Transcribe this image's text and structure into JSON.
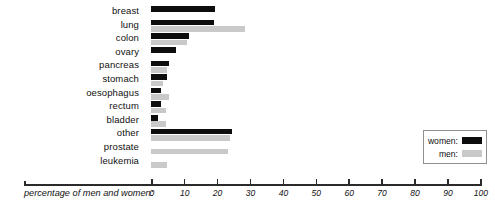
{
  "chart_data": {
    "type": "bar",
    "orientation": "horizontal",
    "title": "",
    "xlabel": "percentage of men and women:",
    "ylabel": "",
    "xlim": [
      0,
      100
    ],
    "xticks": [
      0,
      10,
      20,
      30,
      40,
      50,
      60,
      70,
      80,
      90,
      100
    ],
    "grid": false,
    "legend_position": "right",
    "categories": [
      "breast",
      "lung",
      "colon",
      "ovary",
      "pancreas",
      "stomach",
      "oesophagus",
      "rectum",
      "bladder",
      "other",
      "prostate",
      "leukemia"
    ],
    "series": [
      {
        "name": "women:",
        "color": "#0d0d0d",
        "values": [
          19.5,
          19,
          11.5,
          7.5,
          5.5,
          5,
          3,
          3,
          2,
          24.5,
          0,
          0
        ]
      },
      {
        "name": "men:",
        "color": "#c9c9c9",
        "values": [
          0,
          28.5,
          11,
          0,
          5,
          3.5,
          5.5,
          4.5,
          4.5,
          24,
          23.5,
          5
        ]
      }
    ]
  },
  "axis": {
    "label": "percentage of men and women:",
    "tick_labels": [
      "0",
      "10",
      "20",
      "30",
      "40",
      "50",
      "60",
      "70",
      "80",
      "90",
      "100"
    ]
  },
  "legend": {
    "items": [
      {
        "label": "women:",
        "color": "#0d0d0d"
      },
      {
        "label": "men:",
        "color": "#c9c9c9"
      }
    ]
  }
}
